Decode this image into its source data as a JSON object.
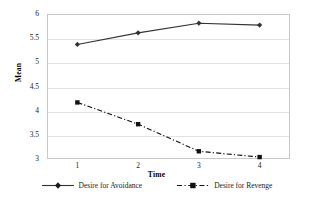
{
  "chart_data": {
    "type": "line",
    "title": "",
    "xlabel": "Time",
    "ylabel": "Mean",
    "x": [
      1,
      2,
      3,
      4
    ],
    "xticklabels": [
      "1",
      "2",
      "3",
      "4"
    ],
    "yticklabels": [
      "6",
      "5.5",
      "5",
      "4.5",
      "4",
      "3.5",
      "3"
    ],
    "yticks": [
      6,
      5.5,
      5,
      4.5,
      4,
      3.5,
      3
    ],
    "ylim": [
      3,
      6
    ],
    "xlim": [
      0.5,
      4.5
    ],
    "grid": "horizontal",
    "legend_position": "bottom",
    "series": [
      {
        "name": "Desire for Avoidance",
        "values": [
          5.37,
          5.61,
          5.81,
          5.77
        ],
        "line_style": "solid",
        "marker": "diamond",
        "color": "#333333"
      },
      {
        "name": "Desire for Revenge",
        "values": [
          4.17,
          3.72,
          3.16,
          3.04
        ],
        "line_style": "dash-dot",
        "marker": "square",
        "color": "#111111"
      }
    ]
  },
  "legend": {
    "entries": [
      {
        "label": "Desire for Avoidance"
      },
      {
        "label": "Desire for Revenge"
      }
    ]
  },
  "colors": {
    "avoidance": "#333333",
    "revenge": "#111111",
    "gridline": "#e2e2e2",
    "frame": "#c9c9c9",
    "background": "#ffffff"
  }
}
